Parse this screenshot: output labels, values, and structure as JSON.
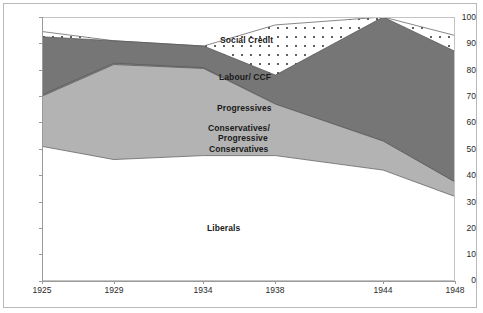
{
  "chart_data": {
    "type": "area",
    "title": "",
    "subtitle": "",
    "xlabel": "",
    "ylabel": "",
    "stacked": true,
    "grid": false,
    "legend_position": "inline-labels",
    "xlim": [
      1925,
      1948
    ],
    "ylim": [
      0,
      100
    ],
    "x": [
      1925,
      1929,
      1934,
      1938,
      1944,
      1948
    ],
    "categories": [
      "1925",
      "1929",
      "1934",
      "1938",
      "1944",
      "1948"
    ],
    "xticks": [
      "1925",
      "1929",
      "1934",
      "1938",
      "1944",
      "1948"
    ],
    "yticks": [
      "0",
      "10",
      "20",
      "30",
      "40",
      "50",
      "60",
      "70",
      "80",
      "90",
      "100"
    ],
    "series": [
      {
        "name": "Liberals",
        "color": "#ffffff",
        "cumulative_top": [
          51,
          46,
          47.5,
          47.5,
          42,
          32
        ],
        "values": [
          51,
          46,
          47.5,
          47.5,
          42,
          32
        ]
      },
      {
        "name": "Conservatives/ Progressive Conservatives",
        "color": "#b3b3b3",
        "cumulative_top": [
          70,
          82,
          80.5,
          67,
          53,
          37.5
        ],
        "values": [
          19,
          36,
          33,
          19.5,
          11,
          5.5
        ]
      },
      {
        "name": "Progressives",
        "color": "#8f8f8f",
        "cumulative_top": [
          70.5,
          82.5,
          80.8,
          67,
          53,
          37.5
        ],
        "values": [
          0.5,
          0.5,
          0.3,
          0,
          0,
          0
        ]
      },
      {
        "name": "Labour/ CCF",
        "color": "#767676",
        "cumulative_top": [
          92.5,
          91,
          89,
          78,
          100,
          87
        ],
        "values": [
          22,
          8.5,
          8.2,
          11,
          47,
          49.5
        ]
      },
      {
        "name": "Social Credit",
        "color": "#ffffff",
        "pattern": "dotted",
        "cumulative_top": [
          94.5,
          91,
          89,
          97,
          100,
          93
        ],
        "values": [
          2,
          0,
          0,
          19,
          0,
          6
        ]
      }
    ],
    "inline_labels": [
      {
        "name": "Social Credit",
        "text": "Social Credit"
      },
      {
        "name": "Labour/ CCF",
        "text": "Labour/ CCF"
      },
      {
        "name": "Progressives",
        "text": "Progressives"
      },
      {
        "name": "Conservatives",
        "line1": "Conservatives/",
        "line2": "Progressive",
        "line3": "Conservatives"
      },
      {
        "name": "Liberals",
        "text": "Liberals"
      }
    ]
  },
  "labels": {
    "social_credit": "Social Credit",
    "labour_ccf": "Labour/ CCF",
    "progressives": "Progressives",
    "conservatives_l1": "Conservatives/",
    "conservatives_l2": "Progressive",
    "conservatives_l3": "Conservatives",
    "liberals": "Liberals"
  },
  "axes": {
    "y": {
      "t0": "0",
      "t10": "10",
      "t20": "20",
      "t30": "30",
      "t40": "40",
      "t50": "50",
      "t60": "60",
      "t70": "70",
      "t80": "80",
      "t90": "90",
      "t100": "100"
    },
    "x": {
      "t1925": "1925",
      "t1929": "1929",
      "t1934": "1934",
      "t1938": "1938",
      "t1944": "1944",
      "t1948": "1948"
    }
  },
  "colors": {
    "liberals": "#ffffff",
    "conservatives": "#b3b3b3",
    "progressives": "#8f8f8f",
    "labour": "#767676",
    "social_credit": "#ffffff",
    "axis": "#9a9a9a",
    "border": "#b9b9b9",
    "text": "#1a1a1a"
  }
}
